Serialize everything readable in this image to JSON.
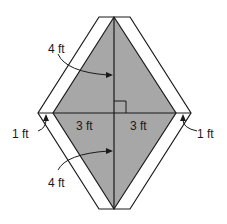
{
  "diagram": {
    "type": "kite-with-border",
    "colors": {
      "fill_inner": "#a7a7a7",
      "fill_border": "#ffffff",
      "stroke": "#1a1a1a"
    },
    "labels": {
      "top_diagonal_half": "4 ft",
      "left_half_width": "3 ft",
      "right_half_width": "3 ft",
      "left_border": "1 ft",
      "right_border": "1 ft",
      "bottom_diagonal_half": "4 ft"
    }
  }
}
